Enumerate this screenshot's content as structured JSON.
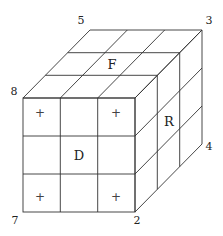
{
  "diagram": {
    "type": "rubiks-cube-3x3x3-isometric",
    "grid_size": 3,
    "line_color": "#333333",
    "background": "#ffffff",
    "face_labels": {
      "top": "F",
      "front": "D",
      "right": "R"
    },
    "corner_labels": {
      "back_top_left": "5",
      "back_top_right": "3",
      "front_top_left": "8",
      "front_bottom_left": "7",
      "front_bottom_right": "2",
      "back_bottom_right": "4"
    },
    "front_face_marks": {
      "symbol": "+",
      "positions": [
        "top-left",
        "top-right",
        "bottom-left",
        "bottom-right"
      ]
    }
  }
}
